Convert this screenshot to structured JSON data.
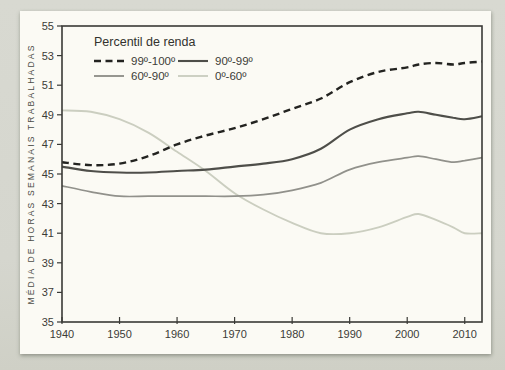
{
  "page": {
    "background_color": "#d6d7cf",
    "card_color": "#fbfaf4"
  },
  "chart_data": {
    "type": "line",
    "title": "",
    "xlabel": "",
    "ylabel": "MÉDIA DE HORAS SEMANAIS TRABALHADAS",
    "legend": {
      "title": "Percentil de renda",
      "position": "top-left-inside"
    },
    "grid": false,
    "axis_color": "#3a3a36",
    "xlim": [
      1940,
      2013
    ],
    "ylim": [
      35,
      55
    ],
    "x_ticks": [
      1940,
      1950,
      1960,
      1970,
      1980,
      1990,
      2000,
      2010
    ],
    "y_ticks": [
      35,
      37,
      39,
      41,
      43,
      45,
      47,
      49,
      51,
      53,
      55
    ],
    "x": [
      1940,
      1945,
      1950,
      1955,
      1960,
      1965,
      1970,
      1975,
      1980,
      1985,
      1990,
      1995,
      2000,
      2002,
      2005,
      2008,
      2010,
      2013
    ],
    "series": [
      {
        "name": "99º-100º",
        "style": "dashed",
        "color": "#232320",
        "width": 2.4,
        "values": [
          45.8,
          45.6,
          45.7,
          46.2,
          47.0,
          47.6,
          48.1,
          48.7,
          49.4,
          50.1,
          51.2,
          51.9,
          52.2,
          52.4,
          52.5,
          52.4,
          52.5,
          52.6
        ]
      },
      {
        "name": "90º-99º",
        "style": "solid",
        "color": "#4e4e49",
        "width": 2.1,
        "values": [
          45.5,
          45.2,
          45.1,
          45.1,
          45.2,
          45.3,
          45.5,
          45.7,
          46.0,
          46.7,
          48.0,
          48.7,
          49.1,
          49.2,
          49.0,
          48.8,
          48.7,
          48.9
        ]
      },
      {
        "name": "60º-90º",
        "style": "solid",
        "color": "#91918b",
        "width": 1.7,
        "values": [
          44.2,
          43.8,
          43.5,
          43.5,
          43.5,
          43.5,
          43.5,
          43.6,
          43.9,
          44.4,
          45.3,
          45.8,
          46.1,
          46.2,
          46.0,
          45.8,
          45.9,
          46.1
        ]
      },
      {
        "name": "0º-60º",
        "style": "solid",
        "color": "#cbcec0",
        "width": 1.9,
        "values": [
          49.3,
          49.2,
          48.7,
          47.8,
          46.5,
          45.2,
          43.7,
          42.6,
          41.7,
          41.0,
          41.0,
          41.4,
          42.1,
          42.3,
          41.9,
          41.4,
          41.0,
          41.0
        ]
      }
    ]
  }
}
